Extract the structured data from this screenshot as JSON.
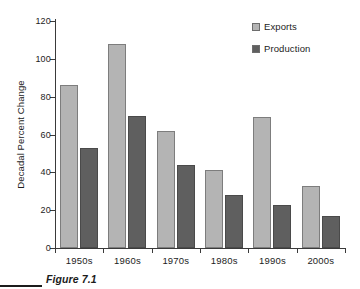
{
  "chart_data": {
    "type": "bar",
    "title": "",
    "xlabel": "",
    "ylabel": "Decadal Percent Change",
    "ylim": [
      0,
      120
    ],
    "yticks": [
      0,
      20,
      40,
      60,
      80,
      100,
      120
    ],
    "ytick_labels": [
      "0",
      "20",
      "40",
      "60",
      "80",
      "100",
      "120"
    ],
    "grid": false,
    "legend_position": "top-right",
    "categories": [
      "1950s",
      "1960s",
      "1970s",
      "1980s",
      "1990s",
      "2000s"
    ],
    "series": [
      {
        "name": "Exports",
        "color": "#b4b4b4",
        "values": [
          86,
          108,
          62,
          41,
          69,
          33
        ]
      },
      {
        "name": "Production",
        "color": "#5f5f5f",
        "values": [
          53,
          70,
          44,
          28,
          23,
          17
        ]
      }
    ]
  },
  "legend": {
    "items": [
      {
        "label": "Exports",
        "swatch": "exports"
      },
      {
        "label": "Production",
        "swatch": "production"
      }
    ]
  },
  "caption": {
    "text": "Figure 7.1"
  }
}
